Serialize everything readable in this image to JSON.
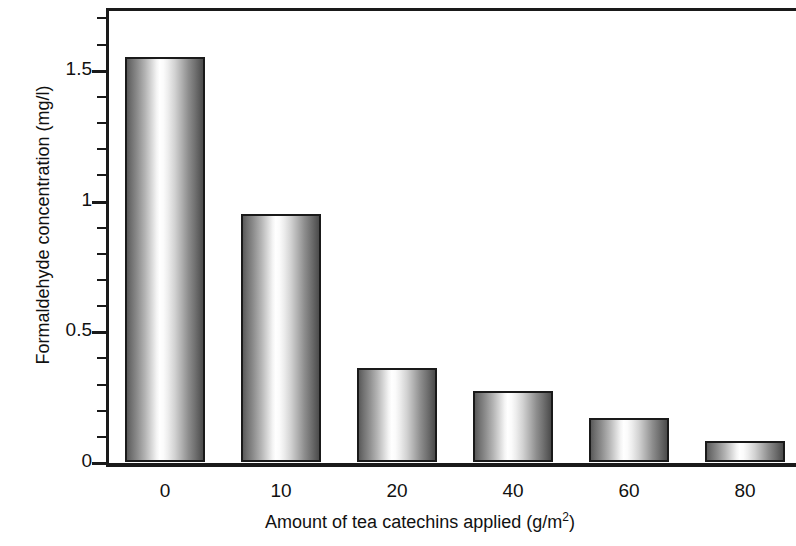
{
  "chart_data": {
    "type": "bar",
    "title": "",
    "xlabel": "Amount of tea catechins applied (g/m2)",
    "xlabel_base": "Amount of tea catechins applied (g/m",
    "xlabel_exponent": "2",
    "xlabel_tail": ")",
    "ylabel": "Formaldehyde concentration (mg/l)",
    "categories": [
      "0",
      "10",
      "20",
      "40",
      "60",
      "80"
    ],
    "values": [
      1.55,
      0.95,
      0.36,
      0.27,
      0.17,
      0.08
    ],
    "ylim": [
      0,
      1.74
    ],
    "ytick_major_values": [
      0,
      0.5,
      1,
      1.5
    ],
    "ytick_major_labels": [
      "0",
      "0.5",
      "1",
      "1.5"
    ],
    "ytick_minor_values": [
      0.1,
      0.2,
      0.3,
      0.4,
      0.6,
      0.7,
      0.8,
      0.9,
      1.1,
      1.2,
      1.3,
      1.4,
      1.6,
      1.7
    ],
    "grid": false,
    "legend": null,
    "bar_fill": "cylindrical-gray-gradient",
    "bar_edge_color": "#1a1a1a",
    "axis_color": "#1a1a1a",
    "background": "#ffffff"
  }
}
